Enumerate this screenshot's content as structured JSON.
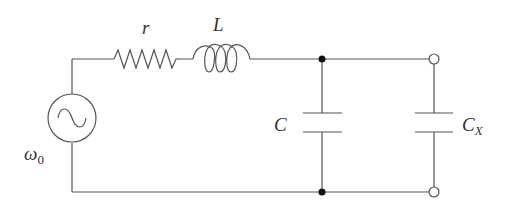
{
  "diagram": {
    "type": "circuit-schematic",
    "colors": {
      "wire": "#555555",
      "label": "#333333",
      "junction": "#111111",
      "background": "#ffffff"
    },
    "components": {
      "source": {
        "label": "ω",
        "subscript": "0",
        "kind": "ac-voltage-source"
      },
      "resistor": {
        "label": "r",
        "kind": "resistor"
      },
      "inductor": {
        "label": "L",
        "kind": "inductor"
      },
      "capacitor": {
        "label": "C",
        "kind": "capacitor"
      },
      "capacitor_x": {
        "label": "C",
        "subscript": "X",
        "kind": "capacitor"
      }
    },
    "nodes": {
      "junctions": [
        "top-junction",
        "bottom-junction"
      ],
      "terminals": [
        "top-terminal",
        "bottom-terminal"
      ]
    }
  }
}
